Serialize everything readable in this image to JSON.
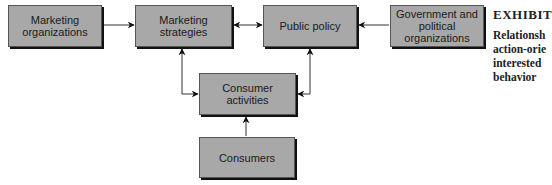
{
  "diagram": {
    "boxes": {
      "marketing_organizations": "Marketing organizations",
      "marketing_strategies": "Marketing strategies",
      "public_policy": "Public policy",
      "government": "Government and political organizations",
      "consumer_activities": "Consumer activities",
      "consumers": "Consumers"
    },
    "edges": [
      {
        "from": "Marketing organizations",
        "to": "Marketing strategies",
        "type": "one-way"
      },
      {
        "from": "Marketing strategies",
        "to": "Public policy",
        "type": "two-way"
      },
      {
        "from": "Government and political organizations",
        "to": "Public policy",
        "type": "one-way"
      },
      {
        "from": "Consumer activities",
        "to": "Marketing strategies",
        "type": "two-way"
      },
      {
        "from": "Consumer activities",
        "to": "Public policy",
        "type": "two-way"
      },
      {
        "from": "Consumers",
        "to": "Consumer activities",
        "type": "one-way"
      }
    ],
    "colors": {
      "box_fill": "#a8a8a8",
      "box_shadow": "#111111",
      "line": "#333333"
    }
  },
  "caption": {
    "exhibit": "EXHIBIT",
    "lines": [
      "Relationsh",
      "action-orie",
      "interested",
      "behavior"
    ]
  }
}
